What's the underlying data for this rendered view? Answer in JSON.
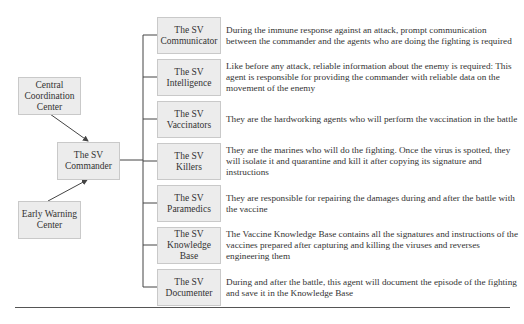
{
  "diagram": {
    "inputs": [
      {
        "id": "central",
        "label": "Central\nCoordination\nCenter"
      },
      {
        "id": "early",
        "label": "Early Warning\nCenter"
      }
    ],
    "hub": {
      "label": "The SV\nCommander"
    },
    "agents": [
      {
        "label": "The SV\nCommunicator",
        "description": "During the immune response against an attack, prompt communication between the commander and the agents who are doing the fighting is required"
      },
      {
        "label": "The SV\nIntelligence",
        "description": "Like before any attack, reliable information about the enemy is required: This agent is responsible for providing the commander with reliable data on the movement of the enemy"
      },
      {
        "label": "The SV\nVaccinators",
        "description": "They are the hardworking agents who will perform the vaccination in the battle"
      },
      {
        "label": "The SV\nKillers",
        "description": "They are the marines who will do the fighting. Once the virus is spotted, they will isolate it and quarantine and kill it after copying its signature and instructions"
      },
      {
        "label": "The SV\nParamedics",
        "description": "They are responsible for repairing the damages during and after the battle with the vaccine"
      },
      {
        "label": "The SV\nKnowledge Base",
        "description": "The Vaccine Knowledge Base contains all the signatures and instructions of the vaccines prepared after capturing and killing the viruses and reverses engineering them"
      },
      {
        "label": "The SV\nDocumenter",
        "description": "During and after the battle, this agent will document the episode of the fighting and save it in the Knowledge Base"
      }
    ],
    "colors": {
      "box_fill": "#ececec",
      "box_border": "#c9c9c9",
      "line": "#444444",
      "text": "#333333"
    }
  }
}
